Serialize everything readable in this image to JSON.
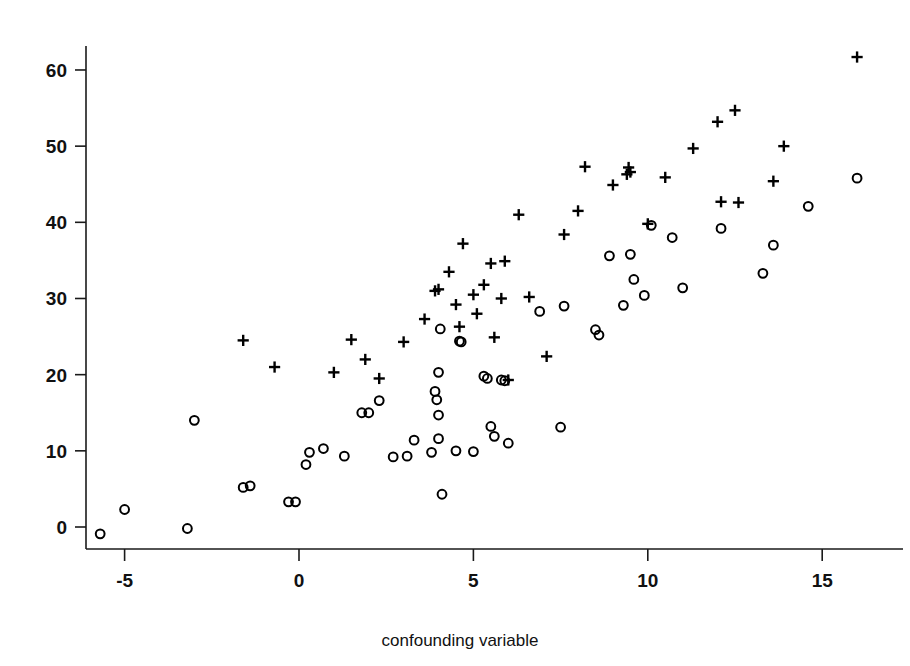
{
  "chart_data": {
    "type": "scatter",
    "title": "",
    "subtitle": "",
    "xlabel": "confounding variable",
    "ylabel": "",
    "xlim": [
      -6.8,
      17.0
    ],
    "ylim": [
      -4.0,
      65.0
    ],
    "xticks": [
      -5,
      0,
      5,
      10,
      15
    ],
    "xtick_labels": [
      "-5",
      "0",
      "5",
      "10",
      "15"
    ],
    "yticks": [
      0,
      10,
      20,
      30,
      40,
      50,
      60
    ],
    "ytick_labels": [
      "0",
      "10",
      "20",
      "30",
      "40",
      "50",
      "60"
    ],
    "grid": false,
    "legend": "none",
    "series": [
      {
        "name": "circle-group",
        "marker": "circle",
        "color": "#000000",
        "points": [
          [
            -5.7,
            -0.9
          ],
          [
            -5.0,
            2.3
          ],
          [
            -3.2,
            -0.2
          ],
          [
            -3.0,
            14.0
          ],
          [
            -1.6,
            5.2
          ],
          [
            -1.4,
            5.4
          ],
          [
            -0.3,
            3.3
          ],
          [
            -0.1,
            3.3
          ],
          [
            0.2,
            8.2
          ],
          [
            0.3,
            9.8
          ],
          [
            0.7,
            10.3
          ],
          [
            1.3,
            9.3
          ],
          [
            1.8,
            15.0
          ],
          [
            2.0,
            15.0
          ],
          [
            2.3,
            16.6
          ],
          [
            2.7,
            9.2
          ],
          [
            3.1,
            9.3
          ],
          [
            3.3,
            11.4
          ],
          [
            3.8,
            9.8
          ],
          [
            4.0,
            20.3
          ],
          [
            3.9,
            17.8
          ],
          [
            3.95,
            16.7
          ],
          [
            4.0,
            14.7
          ],
          [
            4.0,
            11.6
          ],
          [
            4.05,
            26.0
          ],
          [
            4.1,
            4.3
          ],
          [
            4.5,
            10.0
          ],
          [
            4.6,
            24.4
          ],
          [
            4.65,
            24.3
          ],
          [
            5.0,
            9.9
          ],
          [
            5.3,
            19.8
          ],
          [
            5.4,
            19.5
          ],
          [
            5.5,
            13.2
          ],
          [
            5.6,
            11.9
          ],
          [
            5.8,
            19.3
          ],
          [
            5.9,
            19.2
          ],
          [
            6.0,
            11.0
          ],
          [
            6.9,
            28.3
          ],
          [
            7.5,
            13.1
          ],
          [
            7.6,
            29.0
          ],
          [
            8.5,
            25.9
          ],
          [
            8.6,
            25.2
          ],
          [
            8.9,
            35.6
          ],
          [
            9.5,
            35.8
          ],
          [
            9.3,
            29.1
          ],
          [
            9.6,
            32.5
          ],
          [
            9.9,
            30.4
          ],
          [
            10.1,
            39.6
          ],
          [
            10.7,
            38.0
          ],
          [
            11.0,
            31.4
          ],
          [
            12.1,
            39.2
          ],
          [
            13.3,
            33.3
          ],
          [
            13.6,
            37.0
          ],
          [
            14.6,
            42.1
          ],
          [
            16.0,
            45.8
          ]
        ]
      },
      {
        "name": "plus-group",
        "marker": "plus",
        "color": "#000000",
        "points": [
          [
            -1.6,
            24.5
          ],
          [
            -0.7,
            21.0
          ],
          [
            1.0,
            20.3
          ],
          [
            1.5,
            24.6
          ],
          [
            1.9,
            22.0
          ],
          [
            2.3,
            19.5
          ],
          [
            3.0,
            24.3
          ],
          [
            3.6,
            27.3
          ],
          [
            3.9,
            31.0
          ],
          [
            4.0,
            31.2
          ],
          [
            4.3,
            33.5
          ],
          [
            4.5,
            29.2
          ],
          [
            4.6,
            26.3
          ],
          [
            4.7,
            37.2
          ],
          [
            5.0,
            30.5
          ],
          [
            5.1,
            28.0
          ],
          [
            5.3,
            31.8
          ],
          [
            5.5,
            34.6
          ],
          [
            5.6,
            24.9
          ],
          [
            5.8,
            30.0
          ],
          [
            5.9,
            34.9
          ],
          [
            6.0,
            19.3
          ],
          [
            6.3,
            41.0
          ],
          [
            6.6,
            30.2
          ],
          [
            7.1,
            22.4
          ],
          [
            7.6,
            38.4
          ],
          [
            8.0,
            41.5
          ],
          [
            8.2,
            47.3
          ],
          [
            9.0,
            44.9
          ],
          [
            9.4,
            46.3
          ],
          [
            9.45,
            47.2
          ],
          [
            9.5,
            46.6
          ],
          [
            10.0,
            39.8
          ],
          [
            10.5,
            45.9
          ],
          [
            11.3,
            49.7
          ],
          [
            12.0,
            53.2
          ],
          [
            12.1,
            42.7
          ],
          [
            12.5,
            54.7
          ],
          [
            12.6,
            42.6
          ],
          [
            13.6,
            45.4
          ],
          [
            13.9,
            50.0
          ],
          [
            16.0,
            61.7
          ]
        ]
      }
    ]
  },
  "axis": {
    "x_label": "confounding variable"
  }
}
